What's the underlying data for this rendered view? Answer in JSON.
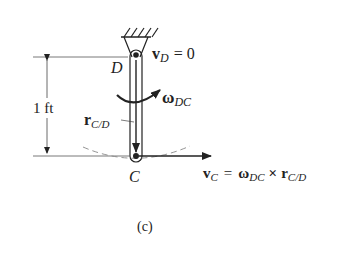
{
  "figure": {
    "caption": "(c)",
    "dimension": {
      "label": "1 ft"
    },
    "points": {
      "pivot": {
        "label": "D"
      },
      "end": {
        "label": "C"
      }
    },
    "vectors": {
      "vD": {
        "symbol": "v",
        "subscript": "D",
        "rhs": "= 0"
      },
      "omega": {
        "symbol": "ω",
        "subscript": "DC"
      },
      "r": {
        "symbol": "r",
        "subscript": "C/D"
      },
      "vC": {
        "lhs_symbol": "v",
        "lhs_subscript": "C",
        "equals": "=",
        "omega_symbol": "ω",
        "omega_subscript": "DC",
        "cross": "×",
        "r_symbol": "r",
        "r_subscript": "C/D"
      }
    },
    "colors": {
      "ink": "#222222",
      "dashed": "#888888"
    }
  }
}
